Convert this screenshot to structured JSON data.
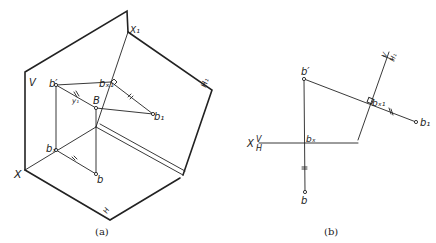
{
  "figure_a": {
    "caption": "(a)",
    "labels": {
      "V": "V",
      "X": "X",
      "X1": "X₁",
      "H1": "H₁",
      "H": "H",
      "b_prime": "b′",
      "b_x1": "bₓ₁",
      "B": "B",
      "b1": "b₁",
      "b_x": "bₓ",
      "b": "b",
      "y1": "y₁"
    }
  },
  "figure_b": {
    "caption": "(b)",
    "labels": {
      "X": "X",
      "V": "V",
      "H": "H",
      "V1_axis": "V",
      "H1_axis": "H₁",
      "b_prime": "b′",
      "b_x1": "bₓ₁",
      "b1": "b₁",
      "b_x": "bₓ",
      "b": "b"
    }
  }
}
